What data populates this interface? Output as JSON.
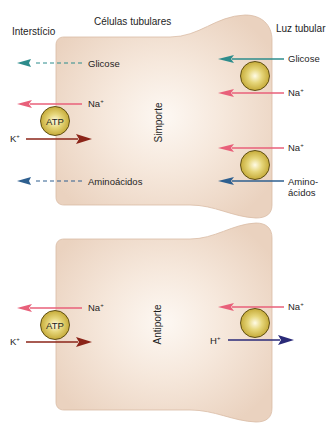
{
  "headers": {
    "interstitium": "Interstício",
    "tubular_cells": "Células tubulares",
    "tubular_lumen": "Luz tubular"
  },
  "top_cell": {
    "transport_type": "Simporte",
    "basolateral": {
      "glucose": "Glicose",
      "sodium": "Na",
      "potassium": "K",
      "pump_label": "ATP",
      "amino_acids": "Aminoácidos"
    },
    "apical": {
      "glucose": "Glicose",
      "sodium_1": "Na",
      "sodium_2": "Na",
      "amino_line1": "Amino-",
      "amino_line2": "ácidos"
    }
  },
  "bottom_cell": {
    "transport_type": "Antiporte",
    "basolateral": {
      "sodium": "Na",
      "potassium": "K",
      "pump_label": "ATP"
    },
    "apical": {
      "sodium": "Na",
      "hydrogen": "H"
    }
  },
  "charge": "+",
  "colors": {
    "cell_fill": "#efd9c6",
    "cell_center": "#fdf8f3",
    "cell_edge": "#d9bba5",
    "glucose_arrow": "#2d8c8c",
    "sodium_arrow": "#e8607a",
    "potassium_arrow": "#8b2418",
    "amino_arrow": "#2e5f8f",
    "hydrogen_arrow": "#2a2a78",
    "pump_gold": "#c8ae3e"
  }
}
